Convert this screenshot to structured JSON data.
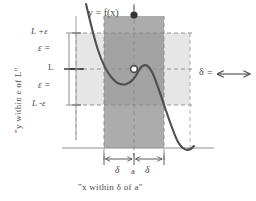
{
  "figure": {
    "title_label": "y = f(x)",
    "captions": {
      "left": "\"y within ε of L\"",
      "bottom": "\"x within δ of a\""
    },
    "y_axis_labels": [
      {
        "name": "L-plus-epsilon",
        "text": "L +ε",
        "y": 33
      },
      {
        "name": "epsilon-upper",
        "text": "ε =",
        "y": 51
      },
      {
        "name": "L",
        "text": "L",
        "y": 69
      },
      {
        "name": "epsilon-lower",
        "text": "ε =",
        "y": 87
      },
      {
        "name": "L-minus-epsilon",
        "text": "L -ε",
        "y": 105
      }
    ],
    "x_axis_labels": [
      {
        "name": "delta-left",
        "text": "δ"
      },
      {
        "name": "a",
        "text": "a"
      },
      {
        "name": "delta-right",
        "text": "δ"
      }
    ],
    "legend": {
      "delta_symbol": "δ",
      "equals": "=",
      "arrow": "⟷"
    },
    "colors": {
      "delta_band": "#a8a8a8",
      "epsilon_band": "#e2e2e2",
      "curve": "#4a4a4a",
      "dashed_guide": "#8f8f8f",
      "axis": "#9a9a9a",
      "background": "#ffffff",
      "text": "#4a4a4a"
    },
    "geometry": {
      "a_x": 134,
      "delta_left_x": 104,
      "delta_right_x": 164,
      "L_y": 69,
      "L_plus_eps_y": 33,
      "L_minus_eps_y": 105,
      "baseline_y": 148,
      "epsilon_band_left_x": 76,
      "epsilon_band_right_x": 190
    },
    "curve_path": "M 86 4 C 94 38, 100 64, 112 78 C 122 90, 132 84, 138 72 C 143 62, 148 63, 153 74 C 160 90, 168 120, 177 140 C 182 150, 188 153, 194 146"
  }
}
